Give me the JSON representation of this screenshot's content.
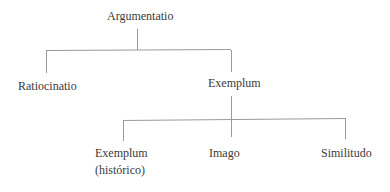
{
  "diagram": {
    "type": "tree",
    "root": {
      "label": "Argumentatio",
      "children": [
        {
          "label": "Ratiocinatio",
          "children": []
        },
        {
          "label": "Exemplum",
          "children": [
            {
              "label": "Exemplum",
              "sublabel": "(histórico)"
            },
            {
              "label": "Imago"
            },
            {
              "label": "Similitudo"
            }
          ]
        }
      ]
    },
    "colors": {
      "text": "#3a3a3a",
      "lines": "#9a9a9a",
      "background": "#ffffff"
    }
  }
}
